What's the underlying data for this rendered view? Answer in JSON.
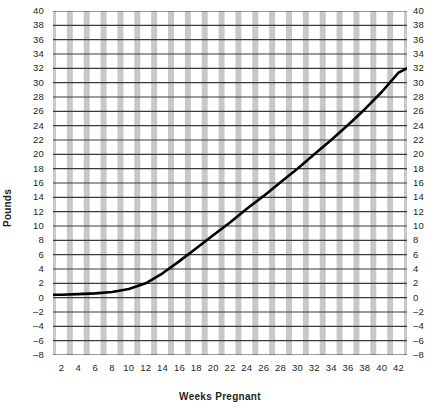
{
  "chart_data": {
    "type": "line",
    "title": "",
    "xlabel": "Weeks Pregnant",
    "ylabel": "Pounds",
    "xlim": [
      1,
      43
    ],
    "ylim": [
      -8,
      40
    ],
    "grid": true,
    "legend": null,
    "x_ticks": [
      2,
      4,
      6,
      8,
      10,
      12,
      14,
      16,
      18,
      20,
      22,
      24,
      26,
      28,
      30,
      32,
      34,
      36,
      38,
      40,
      42
    ],
    "y_ticks": [
      -8,
      -6,
      -4,
      -2,
      0,
      2,
      4,
      6,
      8,
      10,
      12,
      14,
      16,
      18,
      20,
      22,
      24,
      26,
      28,
      30,
      32,
      34,
      36,
      38,
      40
    ],
    "y_axis_right_ticks": [
      -8,
      -6,
      -4,
      -2,
      0,
      2,
      4,
      6,
      8,
      10,
      12,
      14,
      16,
      18,
      20,
      22,
      24,
      26,
      28,
      30,
      32,
      34,
      36,
      38,
      40
    ],
    "series": [
      {
        "name": "Weight gain curve",
        "color": "#000000",
        "x": [
          1,
          2,
          4,
          6,
          8,
          10,
          12,
          14,
          16,
          18,
          20,
          22,
          24,
          26,
          28,
          30,
          32,
          34,
          36,
          38,
          40,
          42,
          43
        ],
        "values": [
          0.4,
          0.4,
          0.5,
          0.6,
          0.8,
          1.2,
          2.0,
          3.4,
          5.1,
          6.9,
          8.7,
          10.5,
          12.4,
          14.2,
          16.1,
          18.0,
          20.0,
          22.0,
          24.1,
          26.3,
          28.7,
          31.4,
          32.0
        ]
      }
    ]
  },
  "plot_style": {
    "band_color": "#c8c8c8",
    "band_white": "#ffffff",
    "gridline_color": "#3a3a3a",
    "curve_color": "#000000",
    "text_color": "#231f20"
  }
}
